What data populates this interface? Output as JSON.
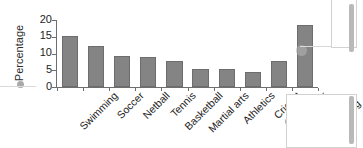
{
  "chart_data": {
    "type": "bar",
    "title": "",
    "xlabel": "",
    "ylabel": "Percentage",
    "ylim": [
      0,
      20
    ],
    "yticks": [
      0,
      5,
      10,
      15,
      20
    ],
    "ytick_labels": [
      "0",
      "5",
      "10",
      "15",
      "20"
    ],
    "grid": false,
    "legend": "none",
    "bar_color": "#848484",
    "bar_edge_color": "#6d6d6d",
    "axis_color": "#6e6e6e",
    "categories": [
      "Swimming",
      "Soccer",
      "Netball",
      "Tennis",
      "Basketball",
      "Martial arts",
      "Athletics",
      "Cricket",
      "Other",
      "Non-\nplaying"
    ],
    "values": [
      15.1,
      12.2,
      9.4,
      8.9,
      7.9,
      5.4,
      5.3,
      4.5,
      7.9,
      18.4
    ]
  },
  "overlay": {
    "marker_dots": [
      {
        "name": "cursor-dot-y-axis",
        "x": 17,
        "y": 81,
        "size": "small"
      },
      {
        "name": "cursor-dot-other-label",
        "x": 285,
        "y": 118,
        "size": "small"
      },
      {
        "name": "cursor-dot-nonplaying-bar",
        "x": 296,
        "y": 45,
        "size": "large"
      }
    ]
  }
}
